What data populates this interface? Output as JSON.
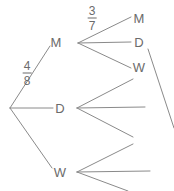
{
  "diagram": {
    "stroke_color": "#8a8a8a",
    "text_color": "#6b6b6b",
    "background_color": "#ffffff"
  },
  "labels": {
    "level1": [
      {
        "id": "l1-m",
        "text": "M",
        "x": 56,
        "y": 42
      },
      {
        "id": "l1-d",
        "text": "D",
        "x": 60,
        "y": 108
      },
      {
        "id": "l1-w",
        "text": "W",
        "x": 60,
        "y": 172
      }
    ],
    "level2": [
      {
        "id": "l2-m",
        "text": "M",
        "x": 139,
        "y": 18
      },
      {
        "id": "l2-d",
        "text": "D",
        "x": 139,
        "y": 42
      },
      {
        "id": "l2-w",
        "text": "W",
        "x": 139,
        "y": 67
      }
    ]
  },
  "fractions": [
    {
      "id": "frac-4-8",
      "numerator": "4",
      "denominator": "8",
      "x": 27,
      "y": 73
    },
    {
      "id": "frac-3-7",
      "numerator": "3",
      "denominator": "7",
      "x": 92,
      "y": 18
    }
  ]
}
